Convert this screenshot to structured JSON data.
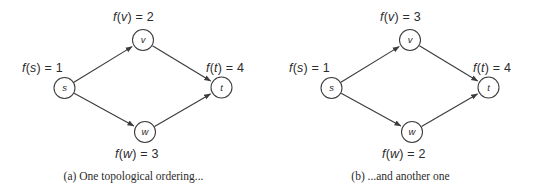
{
  "figure": {
    "type": "graph-diagram",
    "stroke_color": "#3c3c3c",
    "text_color": "#2b2b2b",
    "background": "#ffffff"
  },
  "panels": [
    {
      "id": "a",
      "caption": "(a)  One topological ordering...",
      "caption_tag": "(a)",
      "caption_text": "One topological ordering...",
      "nodes": [
        {
          "id": "s",
          "letter": "s",
          "cx": 64.5,
          "cy": 88,
          "r": 10.5
        },
        {
          "id": "v",
          "letter": "v",
          "cx": 143,
          "cy": 40,
          "r": 10.5
        },
        {
          "id": "w",
          "letter": "w",
          "cx": 145,
          "cy": 132,
          "r": 10.5
        },
        {
          "id": "t",
          "letter": "t",
          "cx": 221.5,
          "cy": 87.5,
          "r": 10.5
        }
      ],
      "edges": [
        {
          "from": "s",
          "to": "v"
        },
        {
          "from": "s",
          "to": "w"
        },
        {
          "from": "v",
          "to": "t"
        },
        {
          "from": "w",
          "to": "t"
        }
      ],
      "labels": [
        {
          "id": "fs",
          "fn": "f",
          "open": "(",
          "var": "s",
          "close": ")",
          "eq": " = ",
          "num": "1",
          "text": "f(s) = 1",
          "x": 22,
          "y": 61
        },
        {
          "id": "fv",
          "fn": "f",
          "open": "(",
          "var": "v",
          "close": ")",
          "eq": " = ",
          "num": "2",
          "text": "f(v) = 2",
          "x": 113,
          "y": 10
        },
        {
          "id": "fw",
          "fn": "f",
          "open": "(",
          "var": "w",
          "close": ")",
          "eq": " = ",
          "num": "3",
          "text": "f(w) = 3",
          "x": 115,
          "y": 147
        },
        {
          "id": "ft",
          "fn": "f",
          "open": "(",
          "var": "t",
          "close": ")",
          "eq": " = ",
          "num": "4",
          "text": "f(t) = 4",
          "x": 206,
          "y": 61
        }
      ]
    },
    {
      "id": "b",
      "caption": "(b)  ...and another one",
      "caption_tag": "(b)",
      "caption_text": "...and another one",
      "nodes": [
        {
          "id": "s",
          "letter": "s",
          "cx": 64.5,
          "cy": 88,
          "r": 10.5
        },
        {
          "id": "v",
          "letter": "v",
          "cx": 143,
          "cy": 40,
          "r": 10.5
        },
        {
          "id": "w",
          "letter": "w",
          "cx": 145,
          "cy": 132,
          "r": 10.5
        },
        {
          "id": "t",
          "letter": "t",
          "cx": 221.5,
          "cy": 87.5,
          "r": 10.5
        }
      ],
      "edges": [
        {
          "from": "s",
          "to": "v"
        },
        {
          "from": "s",
          "to": "w"
        },
        {
          "from": "v",
          "to": "t"
        },
        {
          "from": "w",
          "to": "t"
        }
      ],
      "labels": [
        {
          "id": "fs",
          "fn": "f",
          "open": "(",
          "var": "s",
          "close": ")",
          "eq": " = ",
          "num": "1",
          "text": "f(s) = 1",
          "x": 22,
          "y": 61
        },
        {
          "id": "fv",
          "fn": "f",
          "open": "(",
          "var": "v",
          "close": ")",
          "eq": " = ",
          "num": "3",
          "text": "f(v) = 3",
          "x": 113,
          "y": 10
        },
        {
          "id": "fw",
          "fn": "f",
          "open": "(",
          "var": "w",
          "close": ")",
          "eq": " = ",
          "num": "2",
          "text": "f(w) = 2",
          "x": 115,
          "y": 147
        },
        {
          "id": "ft",
          "fn": "f",
          "open": "(",
          "var": "t",
          "close": ")",
          "eq": " = ",
          "num": "4",
          "text": "f(t) = 4",
          "x": 206,
          "y": 61
        }
      ]
    }
  ]
}
